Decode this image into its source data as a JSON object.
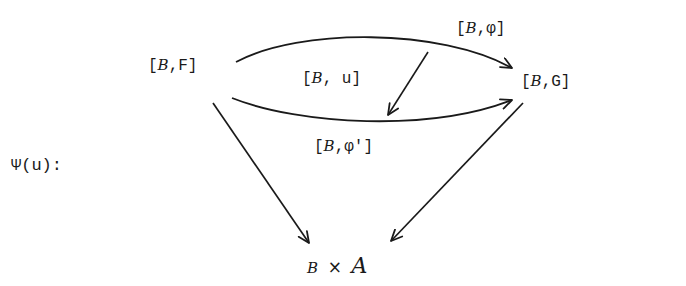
{
  "diagram": {
    "type": "commutative-diagram",
    "title_label": "Ψ(u):",
    "nodes": {
      "source": {
        "prefix": "[",
        "category": "B",
        "sep": ",",
        "object": "F",
        "suffix": "]",
        "text": "[B,F]"
      },
      "target": {
        "prefix": "[",
        "category": "B",
        "sep": ",",
        "object": "G",
        "suffix": "]",
        "text": "[B,G]"
      },
      "bottom": {
        "left": "B",
        "times": "×",
        "right": "A",
        "text": "B × A"
      }
    },
    "edges": {
      "top_arc": {
        "prefix": "[",
        "category": "B",
        "sep": ",",
        "morphism": "φ",
        "suffix": "]",
        "text": "[B,φ]",
        "from": "[B,F]",
        "to": "[B,G]"
      },
      "bottom_arc": {
        "prefix": "[",
        "category": "B",
        "sep": ",",
        "morphism": "φ'",
        "suffix": "]",
        "text": "[B,φ']",
        "from": "[B,F]",
        "to": "[B,G]"
      },
      "two_cell": {
        "prefix": "[",
        "category": "B",
        "sep": ", ",
        "morphism": "u",
        "suffix": "]",
        "text": "[B, u]",
        "from": "[B,φ]",
        "to": "[B,φ']"
      },
      "left_diag": {
        "from": "[B,F]",
        "to": "B × A"
      },
      "right_diag": {
        "from": "[B,G]",
        "to": "B × A"
      }
    },
    "colors": {
      "ink": "#1a1a1a",
      "background": "#ffffff"
    }
  }
}
